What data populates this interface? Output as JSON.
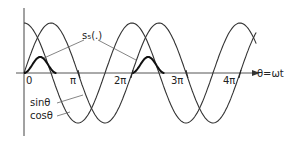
{
  "figure": {
    "annotation_label": "s₅(.)",
    "sin_label": "sinθ",
    "cos_label": "cosθ",
    "axis_label": "θ=ωt",
    "ticks": [
      "0",
      "π",
      "2π",
      "3π",
      "4π"
    ]
  },
  "chart_data": {
    "type": "line",
    "title": "",
    "xlabel": "θ=ωt",
    "ylabel": "",
    "x_ticks": [
      "0",
      "π",
      "2π",
      "3π",
      "4π"
    ],
    "xlim": [
      "0",
      "4.3π"
    ],
    "ylim": [
      -1,
      1
    ],
    "series": [
      {
        "name": "sinθ",
        "function": "sin(θ)"
      },
      {
        "name": "cosθ",
        "function": "cos(θ)"
      },
      {
        "name": "s₅(.)",
        "function": "pulse bumps near θ = 0 and θ = 2π (period 2π), small positive amplitude ~0.3"
      }
    ],
    "annotations": [
      "s₅(.)",
      "sinθ",
      "cosθ"
    ],
    "grid": false
  },
  "colors": {
    "stroke": "#333333",
    "background": "#ffffff"
  }
}
